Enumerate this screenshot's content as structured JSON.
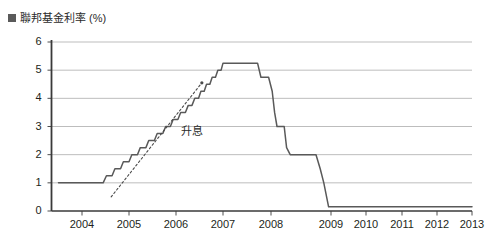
{
  "chart_data": {
    "type": "line",
    "title": "聯邦基金利率 (%)",
    "title_marker": "square-marker",
    "xlabel": "",
    "ylabel": "",
    "ylim": [
      0,
      6
    ],
    "xlim": [
      2003.5,
      2013.0
    ],
    "y_ticks": [
      "0",
      "1",
      "2",
      "3",
      "4",
      "5",
      "6"
    ],
    "y_tick_values": [
      0,
      1,
      2,
      3,
      4,
      5,
      6
    ],
    "x_ticks": [
      "2004",
      "2005",
      "2006",
      "2007",
      "2008",
      "2009",
      "2010",
      "2011",
      "2012",
      "2013"
    ],
    "x_tick_values": [
      2004,
      2005,
      2006,
      2007,
      2008,
      2009,
      2010,
      2011,
      2012,
      2013
    ],
    "grid": "horizontal",
    "legend": "none",
    "line_color": "#595959",
    "grid_color": "#b5b5b5",
    "axis_color": "#3a3a3a",
    "series": [
      {
        "name": "聯邦基金利率",
        "points": [
          [
            2003.5,
            1.0
          ],
          [
            2004.0,
            1.0
          ],
          [
            2004.45,
            1.0
          ],
          [
            2004.52,
            1.25
          ],
          [
            2004.64,
            1.25
          ],
          [
            2004.7,
            1.5
          ],
          [
            2004.82,
            1.5
          ],
          [
            2004.88,
            1.75
          ],
          [
            2005.0,
            1.75
          ],
          [
            2005.06,
            2.0
          ],
          [
            2005.18,
            2.0
          ],
          [
            2005.24,
            2.25
          ],
          [
            2005.36,
            2.25
          ],
          [
            2005.42,
            2.5
          ],
          [
            2005.54,
            2.5
          ],
          [
            2005.6,
            2.75
          ],
          [
            2005.72,
            2.75
          ],
          [
            2005.78,
            3.0
          ],
          [
            2005.88,
            3.0
          ],
          [
            2005.94,
            3.25
          ],
          [
            2006.04,
            3.25
          ],
          [
            2006.1,
            3.5
          ],
          [
            2006.2,
            3.5
          ],
          [
            2006.26,
            3.75
          ],
          [
            2006.34,
            3.75
          ],
          [
            2006.4,
            4.0
          ],
          [
            2006.48,
            4.0
          ],
          [
            2006.53,
            4.25
          ],
          [
            2006.6,
            4.25
          ],
          [
            2006.65,
            4.5
          ],
          [
            2006.72,
            4.5
          ],
          [
            2006.77,
            4.75
          ],
          [
            2006.84,
            4.75
          ],
          [
            2006.89,
            5.0
          ],
          [
            2006.96,
            5.0
          ],
          [
            2007.0,
            5.25
          ],
          [
            2007.72,
            5.25
          ],
          [
            2007.79,
            4.75
          ],
          [
            2007.95,
            4.75
          ],
          [
            2008.02,
            4.25
          ],
          [
            2008.06,
            3.5
          ],
          [
            2008.1,
            3.0
          ],
          [
            2008.22,
            3.0
          ],
          [
            2008.26,
            2.25
          ],
          [
            2008.32,
            2.0
          ],
          [
            2008.75,
            2.0
          ],
          [
            2008.82,
            1.5
          ],
          [
            2008.88,
            1.0
          ],
          [
            2008.96,
            0.15
          ],
          [
            2009.5,
            0.15
          ],
          [
            2010.0,
            0.15
          ],
          [
            2011.0,
            0.15
          ],
          [
            2012.0,
            0.15
          ],
          [
            2013.0,
            0.15
          ]
        ]
      }
    ],
    "annotations": [
      {
        "text": "升息",
        "style": "dotted-arrow",
        "x_from": 2004.62,
        "y_from": 0.5,
        "x_to": 2006.55,
        "y_to": 4.55,
        "label_x": 2006.1,
        "label_y": 2.85
      }
    ]
  }
}
